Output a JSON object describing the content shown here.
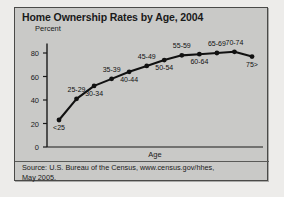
{
  "figure": {
    "title": "Home Ownership Rates by Age, 2004",
    "y_axis_label": "Percent",
    "x_axis_label": "Age",
    "source_line_1": "Source: U.S. Bureau of the Census, www.census.gov/hhes,",
    "source_line_2": "May 2005.",
    "colors": {
      "panel_background": "#c9c9c7",
      "page_background": "#edecea",
      "border": "#4a4a48",
      "line": "#111111",
      "text": "#1a1a1a"
    }
  },
  "chart_data": {
    "type": "line",
    "title": "Home Ownership Rates by Age, 2004",
    "xlabel": "Age",
    "ylabel": "Percent",
    "ylim": [
      0,
      90
    ],
    "yticks": [
      0,
      20,
      40,
      60,
      80
    ],
    "ytick_labels": [
      "0",
      "20",
      "40",
      "60",
      "80"
    ],
    "grid": false,
    "legend": "none",
    "markers": "filled-circle",
    "categories": [
      "<25",
      "25-29",
      "30-34",
      "35-39",
      "40-44",
      "45-49",
      "50-54",
      "55-59",
      "60-64",
      "65-69",
      "70-74",
      "75>"
    ],
    "values": [
      23,
      41,
      52,
      58,
      64,
      69,
      74,
      78,
      79,
      80,
      81,
      77
    ],
    "point_label_positions": [
      "below",
      "above",
      "below",
      "above",
      "below",
      "above",
      "below",
      "above",
      "below",
      "above",
      "above",
      "below"
    ],
    "annotations": [
      "Source: U.S. Bureau of the Census, www.census.gov/hhes, May 2005."
    ]
  }
}
